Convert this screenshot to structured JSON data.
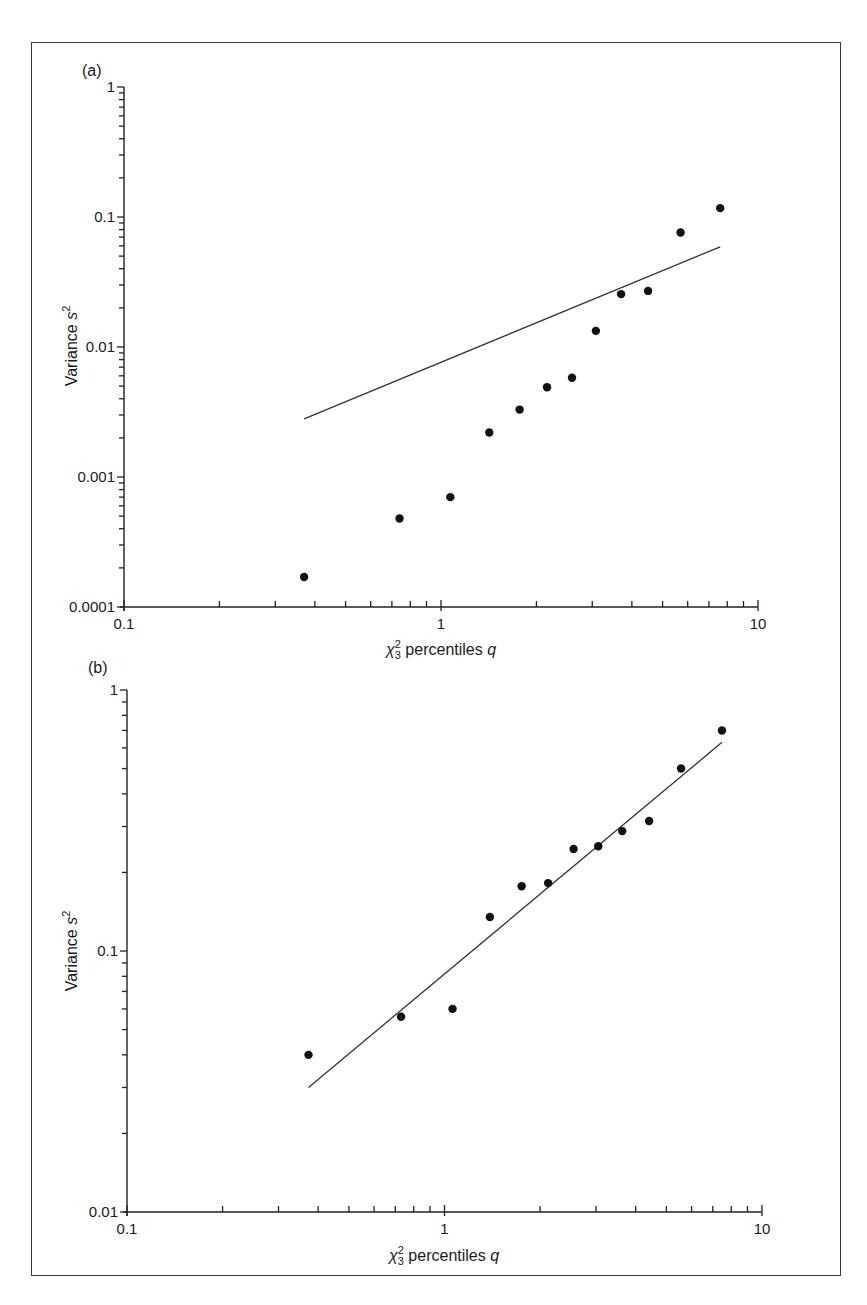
{
  "figure": {
    "panels": [
      {
        "label": "(a)"
      },
      {
        "label": "(b)"
      }
    ]
  },
  "chart_data": [
    {
      "type": "scatter",
      "panel": "(a)",
      "title": "",
      "xlabel": "χ²₃ percentiles q",
      "xlabel_parts": {
        "chi": "χ",
        "sup": "2",
        "sub": "3",
        "rest": " percentiles ",
        "var": "q"
      },
      "ylabel": "Variance s²",
      "ylabel_parts": {
        "main": "Variance ",
        "var": "s",
        "sup": "2"
      },
      "xscale": "log",
      "yscale": "log",
      "xlim": [
        0.1,
        10
      ],
      "ylim": [
        0.0001,
        1
      ],
      "xticks": [
        0.1,
        1,
        10
      ],
      "xtick_labels": [
        "0.1",
        "1",
        "10"
      ],
      "yticks": [
        0.0001,
        0.001,
        0.01,
        0.1,
        1
      ],
      "ytick_labels": [
        "0.0001",
        "0.001",
        "0.01",
        "0.1",
        "1"
      ],
      "grid": false,
      "legend": null,
      "series": [
        {
          "name": "observed variances",
          "kind": "points",
          "x": [
            0.37,
            0.74,
            1.07,
            1.42,
            1.77,
            2.16,
            2.59,
            3.08,
            3.7,
            4.5,
            5.7,
            7.6
          ],
          "y": [
            0.00017,
            0.00048,
            0.0007,
            0.0022,
            0.0033,
            0.0049,
            0.0058,
            0.0133,
            0.0255,
            0.027,
            0.076,
            0.117
          ]
        },
        {
          "name": "reference line",
          "kind": "line",
          "x": [
            0.37,
            7.6
          ],
          "y": [
            0.0028,
            0.059
          ]
        }
      ]
    },
    {
      "type": "scatter",
      "panel": "(b)",
      "title": "",
      "xlabel": "χ²₃ percentiles q",
      "xlabel_parts": {
        "chi": "χ",
        "sup": "2",
        "sub": "3",
        "rest": " percentiles ",
        "var": "q"
      },
      "ylabel": "Variance s²",
      "ylabel_parts": {
        "main": "Variance ",
        "var": "s",
        "sup": "2"
      },
      "xscale": "log",
      "yscale": "log",
      "xlim": [
        0.1,
        10
      ],
      "ylim": [
        0.01,
        1
      ],
      "xticks": [
        0.1,
        1,
        10
      ],
      "xtick_labels": [
        "0.1",
        "1",
        "10"
      ],
      "yticks": [
        0.01,
        0.1,
        1
      ],
      "ytick_labels": [
        "0.01",
        "0.1",
        "1"
      ],
      "grid": false,
      "legend": null,
      "series": [
        {
          "name": "observed variances",
          "kind": "points",
          "x": [
            0.373,
            0.73,
            1.06,
            1.39,
            1.75,
            2.12,
            2.55,
            3.05,
            3.63,
            4.41,
            5.56,
            7.48
          ],
          "y": [
            0.04,
            0.056,
            0.06,
            0.135,
            0.177,
            0.182,
            0.246,
            0.252,
            0.288,
            0.315,
            0.5,
            0.7
          ]
        },
        {
          "name": "reference line",
          "kind": "line",
          "x": [
            0.373,
            7.48
          ],
          "y": [
            0.03,
            0.63
          ]
        }
      ]
    }
  ]
}
